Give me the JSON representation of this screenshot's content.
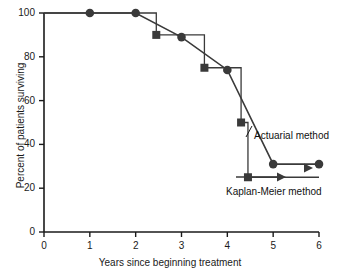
{
  "chart_data": {
    "type": "line",
    "title": "",
    "xlabel": "Years since beginning treatment",
    "ylabel": "Percent of patients surviving",
    "xlim": [
      0,
      6
    ],
    "ylim": [
      0,
      100
    ],
    "xticks": [
      0,
      1,
      2,
      3,
      4,
      5,
      6
    ],
    "xticklabels": [
      "0",
      "1",
      "2",
      "3",
      "4",
      "5",
      "6"
    ],
    "yticks": [
      0,
      20,
      40,
      60,
      80,
      100
    ],
    "yticklabels": [
      "0",
      "20",
      "40",
      "60",
      "80",
      "100"
    ],
    "grid": false,
    "legend_position": "inline-annotation",
    "series": [
      {
        "name": "Actuarial method",
        "marker": "circle",
        "drawstyle": "straight",
        "label_text": "Actuarial method",
        "x": [
          0,
          1,
          2,
          3,
          4,
          5,
          6
        ],
        "y": [
          100,
          100,
          100,
          89,
          74,
          31,
          31
        ]
      },
      {
        "name": "Kaplan-Meier method",
        "marker": "square",
        "drawstyle": "steps-post",
        "label_text": "Kaplan-Meier method",
        "has_arrow": true,
        "x": [
          0,
          2.45,
          3.5,
          4.3,
          4.45,
          6
        ],
        "y": [
          100,
          90,
          75,
          50,
          25,
          25
        ]
      }
    ],
    "annotations": [
      {
        "text": "Actuarial method",
        "x": 5.0,
        "y": 42
      },
      {
        "text": "Kaplan-Meier method",
        "x": 5.0,
        "y": 18
      }
    ],
    "colors": {
      "axis": "#1a1a1a",
      "actuarial": "#3a3a3a",
      "kaplan_meier": "#3a3a3a",
      "text": "#111111",
      "background": "#ffffff"
    }
  },
  "axes": {
    "x_title": "Years since beginning treatment",
    "y_title": "Percent of patients surviving",
    "x_labels": [
      "0",
      "1",
      "2",
      "3",
      "4",
      "5",
      "6"
    ],
    "y_labels": [
      "0",
      "20",
      "40",
      "60",
      "80",
      "100"
    ]
  },
  "labels": {
    "actuarial": "Actuarial method",
    "kaplan_meier": "Kaplan-Meier method"
  }
}
